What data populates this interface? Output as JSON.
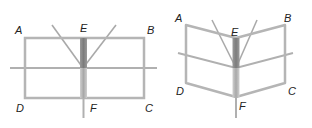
{
  "figures": [
    {
      "name": "flat-door",
      "labels": {
        "A": "A",
        "B": "B",
        "C": "C",
        "D": "D",
        "E": "E",
        "F": "F"
      }
    },
    {
      "name": "folded-door",
      "labels": {
        "A": "A",
        "B": "B",
        "C": "C",
        "D": "D",
        "E": "E",
        "F": "F"
      }
    }
  ],
  "colors": {
    "frame": "#b5b5b5",
    "frame_dark": "#9a9a9a",
    "spine_light": "#d6d6d6",
    "spine_dark": "#8f8f8f",
    "label": "#222222"
  }
}
